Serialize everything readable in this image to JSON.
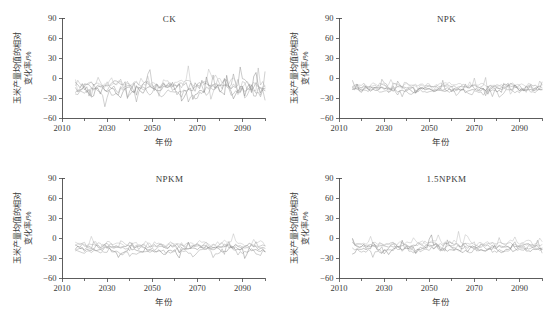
{
  "figure": {
    "width": 554,
    "height": 320,
    "background": "#ffffff",
    "layout": "2x2 grid of line/band time-series panels",
    "axis_color": "#4a4a4a",
    "text_color": "#3a3a3a"
  },
  "labels": {
    "xlabel": "年份",
    "ylabel_line1": "玉米产量均值的相对",
    "ylabel_line2": "变化率/%"
  },
  "chart_data": [
    {
      "type": "line",
      "title": "CK",
      "xlabel": "年份",
      "ylabel": "玉米产量均值的相对变化率/%",
      "xlim": [
        2010,
        2100
      ],
      "ylim": [
        -60,
        90
      ],
      "xticks": [
        2010,
        2030,
        2050,
        2070,
        2090
      ],
      "yticks": [
        -60,
        -30,
        0,
        30,
        60,
        90
      ],
      "minor_xtick_step": 10,
      "grid": false,
      "legend": "none",
      "data_start_year": 2016,
      "data_end_year": 2100,
      "band_mean": -14,
      "band_spread": 13,
      "noise_amplitude": 14,
      "series": [
        {
          "name": "series-1",
          "color": "#8f8f8f",
          "opacity": 0.55,
          "offset": 2.5,
          "seed": 11
        },
        {
          "name": "series-2",
          "color": "#989898",
          "opacity": 0.55,
          "offset": -1.0,
          "seed": 29
        },
        {
          "name": "series-3",
          "color": "#a6a6a6",
          "opacity": 0.5,
          "offset": 4.0,
          "seed": 47
        },
        {
          "name": "series-4",
          "color": "#7e7e7e",
          "opacity": 0.55,
          "offset": -4.5,
          "seed": 61
        },
        {
          "name": "series-5",
          "color": "#b0b0b0",
          "opacity": 0.5,
          "offset": 6.5,
          "seed": 83
        },
        {
          "name": "series-6",
          "color": "#909090",
          "opacity": 0.5,
          "offset": -7.5,
          "seed": 97
        }
      ]
    },
    {
      "type": "line",
      "title": "NPK",
      "xlabel": "年份",
      "ylabel": "玉米产量均值的相对变化率/%",
      "xlim": [
        2010,
        2100
      ],
      "ylim": [
        -60,
        90
      ],
      "xticks": [
        2010,
        2030,
        2050,
        2070,
        2090
      ],
      "yticks": [
        -60,
        -30,
        0,
        30,
        60,
        90
      ],
      "minor_xtick_step": 10,
      "grid": false,
      "legend": "none",
      "data_start_year": 2016,
      "data_end_year": 2100,
      "band_mean": -15,
      "band_spread": 8,
      "noise_amplitude": 7.5,
      "series": [
        {
          "name": "series-1",
          "color": "#8f8f8f",
          "opacity": 0.55,
          "offset": 1.5,
          "seed": 13
        },
        {
          "name": "series-2",
          "color": "#989898",
          "opacity": 0.55,
          "offset": -1.5,
          "seed": 31
        },
        {
          "name": "series-3",
          "color": "#a6a6a6",
          "opacity": 0.5,
          "offset": 3.0,
          "seed": 53
        },
        {
          "name": "series-4",
          "color": "#7e7e7e",
          "opacity": 0.55,
          "offset": -3.5,
          "seed": 67
        },
        {
          "name": "series-5",
          "color": "#b0b0b0",
          "opacity": 0.5,
          "offset": 4.5,
          "seed": 89
        },
        {
          "name": "series-6",
          "color": "#909090",
          "opacity": 0.5,
          "offset": -5.5,
          "seed": 101
        }
      ]
    },
    {
      "type": "line",
      "title": "NPKM",
      "xlabel": "年份",
      "ylabel": "玉米产量均值的相对变化率/%",
      "xlim": [
        2010,
        2100
      ],
      "ylim": [
        -60,
        90
      ],
      "xticks": [
        2010,
        2030,
        2050,
        2070,
        2090
      ],
      "yticks": [
        -60,
        -30,
        0,
        30,
        60,
        90
      ],
      "minor_xtick_step": 10,
      "grid": false,
      "legend": "none",
      "data_start_year": 2016,
      "data_end_year": 2100,
      "band_mean": -14,
      "band_spread": 8.5,
      "noise_amplitude": 8,
      "series": [
        {
          "name": "series-1",
          "color": "#8f8f8f",
          "opacity": 0.55,
          "offset": 1.8,
          "seed": 17
        },
        {
          "name": "series-2",
          "color": "#989898",
          "opacity": 0.55,
          "offset": -1.2,
          "seed": 37
        },
        {
          "name": "series-3",
          "color": "#a6a6a6",
          "opacity": 0.5,
          "offset": 3.4,
          "seed": 59
        },
        {
          "name": "series-4",
          "color": "#7e7e7e",
          "opacity": 0.55,
          "offset": -3.8,
          "seed": 71
        },
        {
          "name": "series-5",
          "color": "#b0b0b0",
          "opacity": 0.5,
          "offset": 5.0,
          "seed": 91
        },
        {
          "name": "series-6",
          "color": "#909090",
          "opacity": 0.5,
          "offset": -6.0,
          "seed": 103
        }
      ]
    },
    {
      "type": "line",
      "title": "1.5NPKM",
      "xlabel": "年份",
      "ylabel": "玉米产量均值的相对变化率/%",
      "xlim": [
        2010,
        2100
      ],
      "ylim": [
        -60,
        90
      ],
      "xticks": [
        2010,
        2030,
        2050,
        2070,
        2090
      ],
      "yticks": [
        -60,
        -30,
        0,
        30,
        60,
        90
      ],
      "minor_xtick_step": 10,
      "grid": false,
      "legend": "none",
      "data_start_year": 2016,
      "data_end_year": 2100,
      "band_mean": -13,
      "band_spread": 8.5,
      "noise_amplitude": 8.5,
      "series": [
        {
          "name": "series-1",
          "color": "#8f8f8f",
          "opacity": 0.55,
          "offset": 1.6,
          "seed": 19
        },
        {
          "name": "series-2",
          "color": "#989898",
          "opacity": 0.55,
          "offset": -1.4,
          "seed": 41
        },
        {
          "name": "series-3",
          "color": "#a6a6a6",
          "opacity": 0.5,
          "offset": 3.2,
          "seed": 73
        },
        {
          "name": "series-4",
          "color": "#7e7e7e",
          "opacity": 0.55,
          "offset": -4.0,
          "seed": 79
        },
        {
          "name": "series-5",
          "color": "#b0b0b0",
          "opacity": 0.5,
          "offset": 5.2,
          "seed": 107
        },
        {
          "name": "series-6",
          "color": "#909090",
          "opacity": 0.5,
          "offset": -5.8,
          "seed": 109
        }
      ]
    }
  ]
}
